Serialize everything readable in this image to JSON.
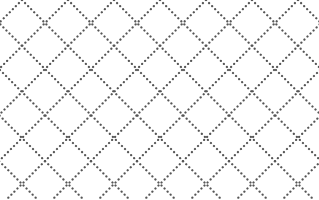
{
  "pattern": {
    "type": "dotted-diamond-lattice",
    "width": 319,
    "height": 200,
    "spacing": 46,
    "offset_x": 22,
    "offset_y": 0,
    "dot_color": "#555555",
    "background": "#ffffff",
    "dot_size": 2.2,
    "dot_gap": 4.2
  }
}
